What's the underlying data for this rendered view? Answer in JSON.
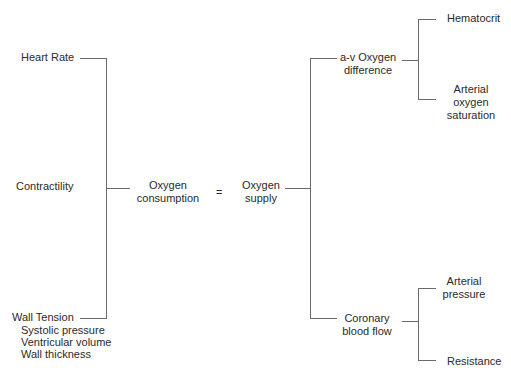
{
  "diagram": {
    "left_factors": {
      "heart_rate": "Heart Rate",
      "contractility": "Contractility",
      "wall_tension": "Wall Tension",
      "wall_tension_sub": [
        "Systolic pressure",
        "Ventricular volume",
        "Wall thickness"
      ]
    },
    "center": {
      "consumption": [
        "Oxygen",
        "consumption"
      ],
      "equals": "=",
      "supply": [
        "Oxygen",
        "supply"
      ]
    },
    "right_factors": {
      "av_difference": [
        "a-v Oxygen",
        "difference"
      ],
      "av_sub": {
        "hematocrit": "Hematocrit",
        "arterial_saturation": [
          "Arterial",
          "oxygen",
          "saturation"
        ]
      },
      "coronary_flow": [
        "Coronary",
        "blood flow"
      ],
      "coronary_sub": {
        "arterial_pressure": [
          "Arterial",
          "pressure"
        ],
        "resistance": "Resistance"
      }
    }
  }
}
